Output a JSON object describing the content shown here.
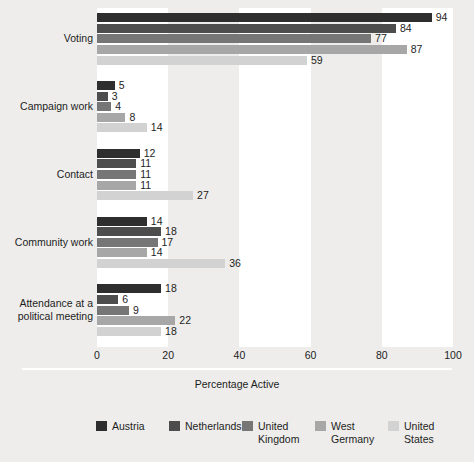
{
  "chart_data": {
    "type": "bar",
    "orientation": "horizontal",
    "title": "",
    "xlabel": "Percentage Active",
    "ylabel": "",
    "xlim": [
      0,
      100
    ],
    "xticks": [
      0,
      20,
      40,
      60,
      80,
      100
    ],
    "xtick_labels": [
      "0",
      "20",
      "40",
      "60",
      "80",
      "100"
    ],
    "grid": false,
    "alternating_bands": true,
    "legend_position": "bottom",
    "categories": [
      "Voting",
      "Campaign work",
      "Contact",
      "Community work",
      "Attendance at a\npolitical meeting"
    ],
    "series": [
      {
        "name": "Austria",
        "color": "#2e2e2e",
        "values": [
          94,
          5,
          12,
          14,
          18
        ]
      },
      {
        "name": "Netherlands",
        "color": "#4d4d4d",
        "values": [
          84,
          3,
          11,
          18,
          6
        ]
      },
      {
        "name": "United\nKingdom",
        "color": "#767676",
        "values": [
          77,
          4,
          11,
          17,
          9
        ]
      },
      {
        "name": "West\nGermany",
        "color": "#a7a7a7",
        "values": [
          87,
          8,
          11,
          14,
          22
        ]
      },
      {
        "name": "United\nStates",
        "color": "#d2d2d2",
        "values": [
          59,
          14,
          27,
          36,
          18
        ]
      }
    ]
  },
  "figure": {
    "background_color": "#eeedeb",
    "band_color": "#ffffff",
    "text_color": "#1d1d1d"
  }
}
